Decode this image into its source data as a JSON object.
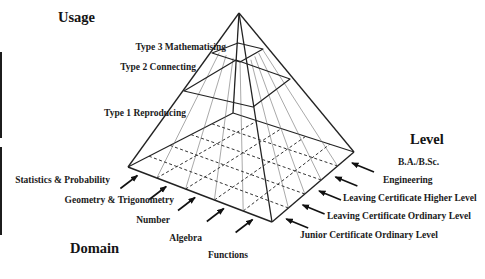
{
  "figure": {
    "usage": {
      "title": "Usage",
      "types": [
        "Type 3 Mathematising",
        "Type 2 Connecting",
        "Type 1 Reproducing"
      ]
    },
    "level": {
      "title": "Level",
      "items": [
        "B.A./B.Sc.",
        "Engineering",
        "Leaving Certificate Higher Level",
        "Leaving Certificate Ordinary Level",
        "Junior Certificate Ordinary Level"
      ]
    },
    "domain": {
      "title": "Domain",
      "items": [
        "Statistics & Probability",
        "Geometry & Trigonometry",
        "Number",
        "Algebra",
        "Functions"
      ]
    },
    "colors": {
      "background": "#ffffff",
      "line": "#222222",
      "face_grid_line": "#6e6e6e",
      "base_grid_line": "#333333",
      "arrow": "#111111",
      "text": "#1b1b1b"
    }
  }
}
